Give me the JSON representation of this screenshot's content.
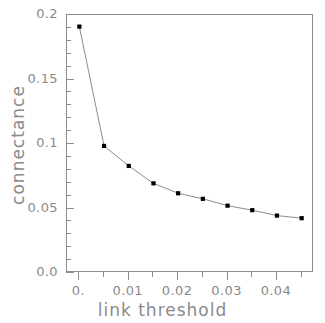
{
  "chart_data": {
    "type": "line",
    "title": "",
    "xlabel": "link threshold",
    "ylabel": "connectance",
    "xlim": [
      -0.0025,
      0.0475
    ],
    "ylim": [
      0.0,
      0.2
    ],
    "grid": false,
    "legend": null,
    "marker": "square",
    "marker_color": "#000000",
    "line_color": "#8c8c8c",
    "axis_color": "#8c8c8c",
    "text_color": "#8a8a8a",
    "x": [
      0.0,
      0.005,
      0.01,
      0.015,
      0.02,
      0.025,
      0.03,
      0.035,
      0.04,
      0.045
    ],
    "y": [
      0.191,
      0.0985,
      0.083,
      0.0695,
      0.0618,
      0.0575,
      0.0522,
      0.0487,
      0.0445,
      0.0425
    ],
    "xticks": [
      {
        "value": 0.0,
        "label": "0.",
        "major": true
      },
      {
        "value": 0.005,
        "label": "",
        "major": false
      },
      {
        "value": 0.01,
        "label": "0.01",
        "major": true
      },
      {
        "value": 0.015,
        "label": "",
        "major": false
      },
      {
        "value": 0.02,
        "label": "0.02",
        "major": true
      },
      {
        "value": 0.025,
        "label": "",
        "major": false
      },
      {
        "value": 0.03,
        "label": "0.03",
        "major": true
      },
      {
        "value": 0.035,
        "label": "",
        "major": false
      },
      {
        "value": 0.04,
        "label": "0.04",
        "major": true
      },
      {
        "value": 0.045,
        "label": "",
        "major": false
      }
    ],
    "yticks": [
      {
        "value": 0.0,
        "label": "0.0",
        "major": true
      },
      {
        "value": 0.01,
        "label": "",
        "major": false
      },
      {
        "value": 0.02,
        "label": "",
        "major": false
      },
      {
        "value": 0.03,
        "label": "",
        "major": false
      },
      {
        "value": 0.04,
        "label": "",
        "major": false
      },
      {
        "value": 0.05,
        "label": "0.05",
        "major": true
      },
      {
        "value": 0.06,
        "label": "",
        "major": false
      },
      {
        "value": 0.07,
        "label": "",
        "major": false
      },
      {
        "value": 0.08,
        "label": "",
        "major": false
      },
      {
        "value": 0.09,
        "label": "",
        "major": false
      },
      {
        "value": 0.1,
        "label": "0.1",
        "major": true
      },
      {
        "value": 0.11,
        "label": "",
        "major": false
      },
      {
        "value": 0.12,
        "label": "",
        "major": false
      },
      {
        "value": 0.13,
        "label": "",
        "major": false
      },
      {
        "value": 0.14,
        "label": "",
        "major": false
      },
      {
        "value": 0.15,
        "label": "0.15",
        "major": true
      },
      {
        "value": 0.16,
        "label": "",
        "major": false
      },
      {
        "value": 0.17,
        "label": "",
        "major": false
      },
      {
        "value": 0.18,
        "label": "",
        "major": false
      },
      {
        "value": 0.19,
        "label": "",
        "major": false
      },
      {
        "value": 0.2,
        "label": "0.2",
        "major": true
      }
    ]
  }
}
